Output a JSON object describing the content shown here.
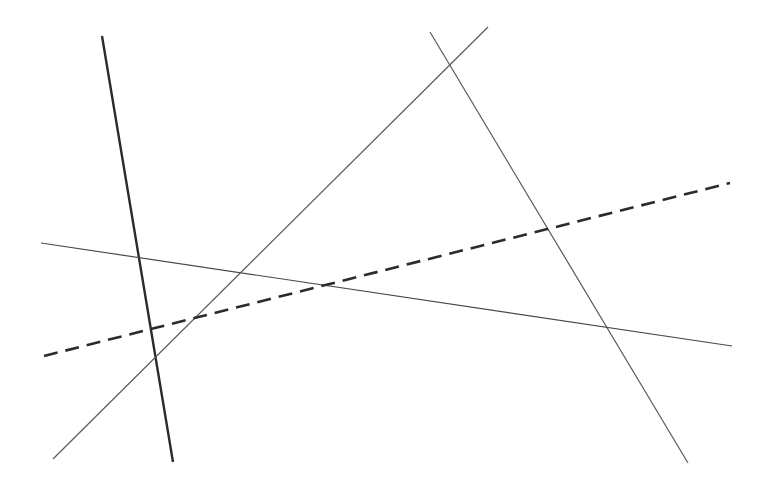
{
  "canvas": {
    "width": 768,
    "height": 487,
    "background": "#ffffff"
  },
  "lines": [
    {
      "id": "thick-steep-line",
      "x1": 102,
      "y1": 36,
      "x2": 173,
      "y2": 462,
      "stroke": "#2b2b2b",
      "width": 2.4,
      "dash": ""
    },
    {
      "id": "rising-diagonal-line",
      "x1": 53,
      "y1": 459,
      "x2": 488,
      "y2": 27,
      "stroke": "#5a5a5a",
      "width": 1.2,
      "dash": ""
    },
    {
      "id": "falling-diagonal-line",
      "x1": 430,
      "y1": 32,
      "x2": 688,
      "y2": 463,
      "stroke": "#5a5a5a",
      "width": 1.2,
      "dash": ""
    },
    {
      "id": "shallow-horizontal-line",
      "x1": 41,
      "y1": 243,
      "x2": 732,
      "y2": 346,
      "stroke": "#4a4a4a",
      "width": 1.2,
      "dash": ""
    },
    {
      "id": "dashed-line",
      "x1": 44,
      "y1": 356,
      "x2": 730,
      "y2": 183,
      "stroke": "#2b2b2b",
      "width": 2.6,
      "dash": "14 8"
    }
  ]
}
